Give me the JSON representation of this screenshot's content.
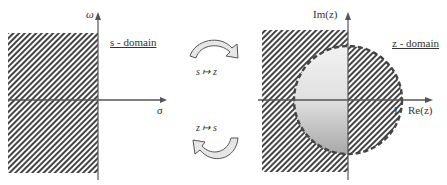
{
  "s_domain": {
    "title": "s - domain",
    "axis_vertical": "ω",
    "axis_horizontal": "σ"
  },
  "z_domain": {
    "title": "z - domain",
    "axis_vertical": "Im(z)",
    "axis_horizontal": "Re(z)",
    "unit_marker": "1"
  },
  "mappings": {
    "forward": "s ↦ z",
    "inverse": "z ↦ s"
  }
}
